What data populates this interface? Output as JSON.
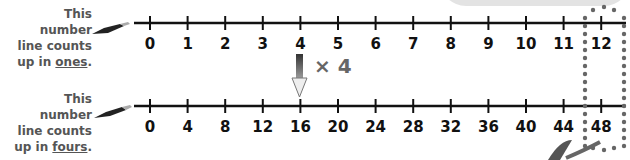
{
  "top_line": {
    "caption": {
      "line1": "This number",
      "line2": "line counts",
      "line3_prefix": "up in ",
      "line3_keyword": "ones",
      "line3_suffix": "."
    },
    "labels": [
      "0",
      "1",
      "2",
      "3",
      "4",
      "5",
      "6",
      "7",
      "8",
      "9",
      "10",
      "11",
      "12"
    ]
  },
  "bottom_line": {
    "caption": {
      "line1": "This number",
      "line2": "line counts",
      "line3_prefix": "up in ",
      "line3_keyword": "fours",
      "line3_suffix": "."
    },
    "labels": [
      "0",
      "4",
      "8",
      "12",
      "16",
      "20",
      "24",
      "28",
      "32",
      "36",
      "40",
      "44",
      "48"
    ]
  },
  "arrow": {
    "label": "× 4",
    "from_value": "4",
    "to_value": "16"
  },
  "highlight": {
    "top_value": "12",
    "bottom_value": "48",
    "style": "dotted-loop"
  },
  "colors": {
    "line": "#111111",
    "caption": "#555555",
    "arrow_dark": "#444444",
    "dots": "#666666"
  }
}
